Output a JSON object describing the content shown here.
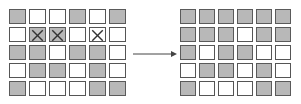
{
  "colors": {
    "filled": "#b8b8b8",
    "empty": "#ffffff",
    "border": "#555555"
  },
  "left_grid": {
    "label": "before",
    "rows": [
      [
        "filled",
        "empty",
        "empty",
        "filled",
        "empty",
        "filled"
      ],
      [
        "empty",
        "filled-x",
        "filled-x",
        "empty",
        "empty-x",
        "empty"
      ],
      [
        "filled",
        "filled",
        "empty",
        "filled",
        "filled",
        "empty"
      ],
      [
        "empty",
        "filled",
        "filled",
        "empty",
        "filled",
        "empty"
      ],
      [
        "filled",
        "empty",
        "empty",
        "empty",
        "filled",
        "filled"
      ]
    ]
  },
  "arrow": {
    "icon": "right-arrow-icon"
  },
  "right_grid": {
    "label": "after",
    "rows": [
      [
        "filled",
        "filled",
        "filled",
        "filled",
        "filled",
        "filled"
      ],
      [
        "filled",
        "filled",
        "filled",
        "empty",
        "filled",
        "filled"
      ],
      [
        "filled",
        "empty",
        "filled",
        "filled",
        "empty",
        "empty"
      ],
      [
        "empty",
        "filled",
        "filled",
        "empty",
        "filled",
        "empty"
      ],
      [
        "filled",
        "empty",
        "empty",
        "empty",
        "filled",
        "filled"
      ]
    ]
  }
}
